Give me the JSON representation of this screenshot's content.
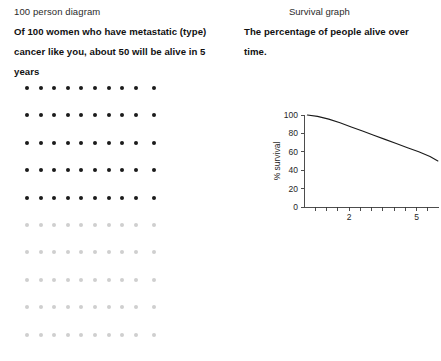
{
  "left": {
    "caption": "100 person diagram",
    "statement": "Of 100 women who have metastatic (type) cancer like you, about 50 will be alive in 5 years",
    "grid": {
      "columns": 10,
      "rows": 10,
      "total": 100,
      "alive_count": 50,
      "dead_count": 50,
      "alive_color": "#1b1b1b",
      "dead_color": "#cfcfcf"
    }
  },
  "right": {
    "caption": "Survival graph",
    "statement": "The percentage of people alive over time.",
    "chart_data": {
      "type": "line",
      "title": "Survival graph",
      "xlabel": "",
      "ylabel": "% survival",
      "xlim": [
        0,
        6
      ],
      "ylim": [
        0,
        100
      ],
      "grid": false,
      "legend": "none",
      "y_ticks": [
        0,
        20,
        40,
        60,
        80,
        100
      ],
      "y_tick_labels": [
        "0",
        "20",
        "40",
        "60",
        "80",
        "100"
      ],
      "x_ticks": [
        0.5,
        1,
        1.5,
        2,
        2.5,
        3,
        3.5,
        4,
        4.5,
        5,
        5.5
      ],
      "x_tick_labels": [
        "",
        "",
        "",
        "2",
        "",
        "",
        "",
        "",
        "",
        "5",
        ""
      ],
      "series": [
        {
          "name": "% survival",
          "x": [
            0.15,
            0.6,
            1.1,
            1.6,
            2.1,
            2.6,
            3.1,
            3.6,
            4.1,
            4.6,
            5.1,
            5.6,
            5.95
          ],
          "y": [
            100,
            98.5,
            95.5,
            91.5,
            87,
            82.5,
            78,
            73.5,
            69,
            64.5,
            60,
            55,
            50
          ]
        }
      ],
      "line_color": "#1a1a1a"
    }
  }
}
